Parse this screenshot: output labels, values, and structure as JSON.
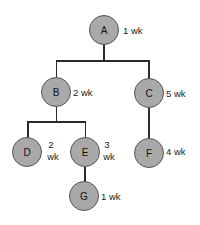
{
  "diagram": {
    "type": "tree",
    "nodes": [
      {
        "id": "A",
        "label": "A",
        "duration": "1 wk"
      },
      {
        "id": "B",
        "label": "B",
        "duration": "2 wk"
      },
      {
        "id": "C",
        "label": "C",
        "duration": "5 wk"
      },
      {
        "id": "D",
        "label": "D",
        "duration_num": "2",
        "duration_unit": "wk"
      },
      {
        "id": "E",
        "label": "E",
        "duration_num": "3",
        "duration_unit": "wk"
      },
      {
        "id": "F",
        "label": "F",
        "duration": "4 wk"
      },
      {
        "id": "G",
        "label": "G",
        "duration": "1 wk"
      }
    ],
    "edges": [
      {
        "from": "A",
        "to": "B"
      },
      {
        "from": "A",
        "to": "C"
      },
      {
        "from": "B",
        "to": "D"
      },
      {
        "from": "B",
        "to": "E"
      },
      {
        "from": "C",
        "to": "F"
      },
      {
        "from": "E",
        "to": "G"
      }
    ],
    "colors": {
      "node_fill": "#a9a9a9",
      "node_border": "#555555",
      "line": "#2a2a2a",
      "background": "#ffffff"
    }
  }
}
